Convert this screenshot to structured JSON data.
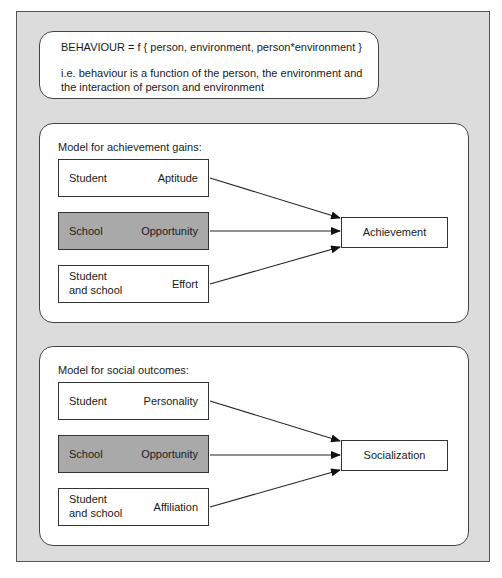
{
  "formula": {
    "equation": "BEHAVIOUR = f { person, environment, person*environment }",
    "explanation_line1": "i.e. behaviour is a function of the person, the environment and",
    "explanation_line2": "the interaction of person and environment"
  },
  "models": [
    {
      "title": "Model for achievement gains:",
      "inputs": [
        {
          "left": "Student",
          "left2": "",
          "right": "Aptitude",
          "shaded": false
        },
        {
          "left": "School",
          "left2": "",
          "right": "Opportunity",
          "shaded": true
        },
        {
          "left": "Student",
          "left2": "and school",
          "right": "Effort",
          "shaded": false
        }
      ],
      "outcome": "Achievement"
    },
    {
      "title": "Model for social outcomes:",
      "inputs": [
        {
          "left": "Student",
          "left2": "",
          "right": "Personality",
          "shaded": false
        },
        {
          "left": "School",
          "left2": "",
          "right": "Opportunity",
          "shaded": true
        },
        {
          "left": "Student",
          "left2": "and school",
          "right": "Affiliation",
          "shaded": false
        }
      ],
      "outcome": "Socialization"
    }
  ],
  "colors": {
    "frame_bg": "#dcdcdc",
    "shaded_box": "#a9a9a9",
    "border": "#333333"
  }
}
